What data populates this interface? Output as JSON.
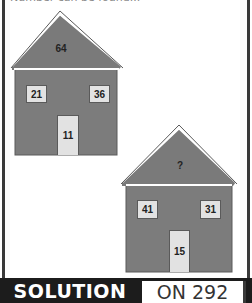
{
  "header": {
    "instruction_text": "Number can be found..."
  },
  "colors": {
    "house_fill": "#7c7c7c",
    "roof_fill": "#7a7a7a",
    "roof_outline": "#555555",
    "window_fill": "#e2e2e2",
    "bar_bg": "#1c1c1c"
  },
  "houses": [
    {
      "roof": "64",
      "window_left": "21",
      "window_right": "36",
      "door": "11"
    },
    {
      "roof": "?",
      "window_left": "41",
      "window_right": "31",
      "door": "15"
    }
  ],
  "footer": {
    "solution_label": "SOLUTION",
    "page_ref": "ON 292"
  }
}
